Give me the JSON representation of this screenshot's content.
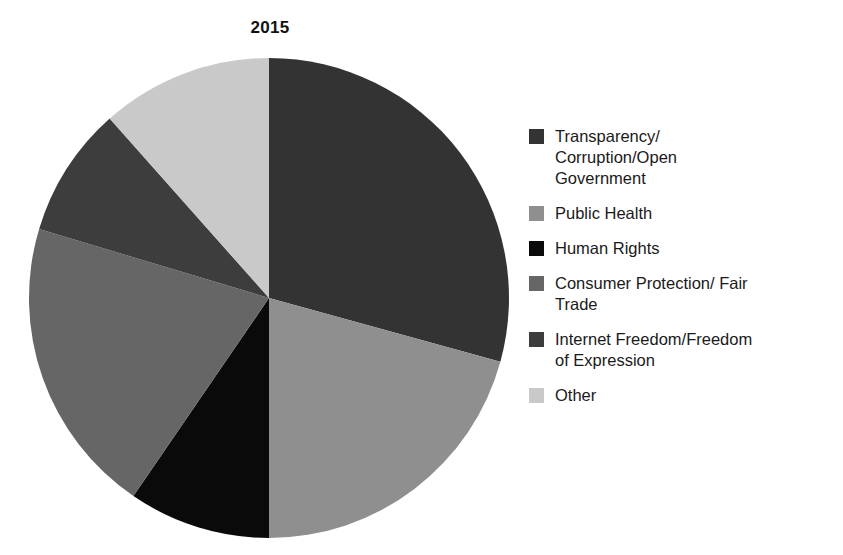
{
  "chart_data": {
    "type": "pie",
    "title": "2015",
    "xlabel": "",
    "ylabel": "",
    "legend_position": "right",
    "grid": false,
    "start_angle_deg": 0,
    "direction": "clockwise",
    "categories": [
      "Transparency/\nCorruption/Open\nGovernment",
      "Public Health",
      "Human Rights",
      "Consumer Protection/ Fair\nTrade",
      "Internet Freedom/Freedom\nof Expression",
      "Other"
    ],
    "values": [
      29.3,
      20.7,
      9.6,
      20.1,
      8.8,
      11.5
    ],
    "units": "percent",
    "slices": [
      {
        "label": "Transparency/\nCorruption/Open\nGovernment",
        "label_plain": "Transparency/Corruption/Open Government",
        "value": 29.3,
        "start_deg": 0.0,
        "end_deg": 105.4,
        "color": "#333333"
      },
      {
        "label": "Public Health",
        "label_plain": "Public Health",
        "value": 20.7,
        "start_deg": 105.4,
        "end_deg": 180.0,
        "color": "#8f8f8f"
      },
      {
        "label": "Human Rights",
        "label_plain": "Human Rights",
        "value": 9.6,
        "start_deg": 180.0,
        "end_deg": 214.4,
        "color": "#0a0a0a"
      },
      {
        "label": "Consumer Protection/ Fair\nTrade",
        "label_plain": "Consumer Protection/ Fair Trade",
        "value": 20.1,
        "start_deg": 214.4,
        "end_deg": 286.7,
        "color": "#666666"
      },
      {
        "label": "Internet Freedom/Freedom\nof Expression",
        "label_plain": "Internet Freedom/Freedom of Expression",
        "value": 8.8,
        "start_deg": 286.7,
        "end_deg": 318.4,
        "color": "#3d3d3d"
      },
      {
        "label": "Other",
        "label_plain": "Other",
        "value": 11.5,
        "start_deg": 318.4,
        "end_deg": 360.0,
        "color": "#c9c9c9"
      }
    ],
    "colors": [
      "#333333",
      "#8f8f8f",
      "#0a0a0a",
      "#666666",
      "#3d3d3d",
      "#c9c9c9"
    ]
  },
  "figure": {
    "title": "2015",
    "background": "#ffffff"
  },
  "legend": {
    "items": [
      {
        "label": "Transparency/\nCorruption/Open\nGovernment",
        "color": "#333333"
      },
      {
        "label": "Public Health",
        "color": "#8f8f8f"
      },
      {
        "label": "Human Rights",
        "color": "#0a0a0a"
      },
      {
        "label": "Consumer Protection/ Fair\nTrade",
        "color": "#666666"
      },
      {
        "label": "Internet Freedom/Freedom\nof Expression",
        "color": "#3d3d3d"
      },
      {
        "label": "Other",
        "color": "#c9c9c9"
      }
    ]
  }
}
